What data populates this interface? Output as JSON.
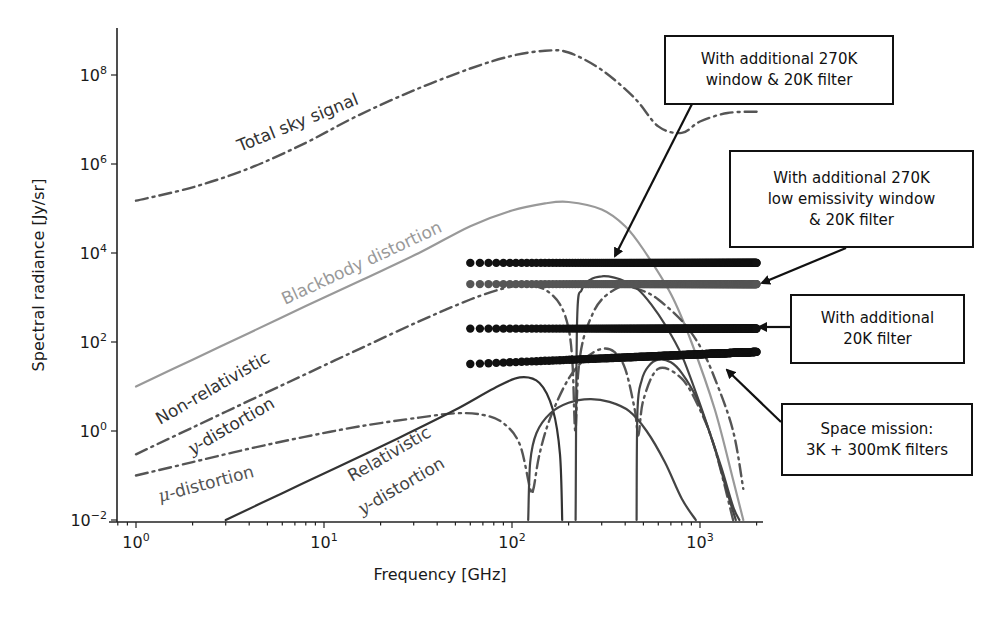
{
  "chart_data": {
    "type": "line",
    "title": "",
    "xlabel": "Frequency [GHz]",
    "ylabel": "Spectral radiance [Jy/sr]",
    "xscale": "log",
    "yscale": "log",
    "xlim": [
      0.78,
      2200
    ],
    "ylim": [
      0.01,
      1000000000.0
    ],
    "grid": false,
    "x_ticks": [
      {
        "value": 1,
        "base": "10",
        "exp": "0"
      },
      {
        "value": 10,
        "base": "10",
        "exp": "1"
      },
      {
        "value": 100,
        "base": "10",
        "exp": "2"
      },
      {
        "value": 1000,
        "base": "10",
        "exp": "3"
      }
    ],
    "y_ticks": [
      {
        "value": 0.01,
        "base": "10",
        "exp": "−2"
      },
      {
        "value": 1,
        "base": "10",
        "exp": "0"
      },
      {
        "value": 100,
        "base": "10",
        "exp": "2"
      },
      {
        "value": 10000,
        "base": "10",
        "exp": "4"
      },
      {
        "value": 1000000,
        "base": "10",
        "exp": "6"
      },
      {
        "value": 100000000,
        "base": "10",
        "exp": "8"
      }
    ],
    "series": [
      {
        "name": "Total sky signal",
        "style": "dashdot",
        "color": "#555555",
        "x": [
          1,
          2,
          4,
          8,
          15,
          30,
          60,
          100,
          150,
          200,
          300,
          450,
          600,
          800,
          1000,
          1400,
          2000
        ],
        "y": [
          150000.0,
          300000.0,
          800000.0,
          3000000.0,
          12000000.0,
          45000000.0,
          140000000.0,
          270000000.0,
          350000000.0,
          320000000.0,
          130000000.0,
          30000000.0,
          7000000.0,
          5000000.0,
          9000000.0,
          14000000.0,
          15000000.0
        ]
      },
      {
        "name": "Blackbody distortion",
        "style": "solid",
        "color": "#999999",
        "x": [
          1,
          2,
          4,
          8,
          16,
          32,
          60,
          100,
          150,
          200,
          300,
          400,
          500,
          700,
          900,
          1200,
          1500,
          1700
        ],
        "y": [
          10,
          40,
          160,
          640,
          2500,
          10000,
          40000,
          90000,
          130000,
          140000,
          95000,
          40000,
          12000,
          1200,
          100,
          3,
          0.08,
          0.01
        ]
      },
      {
        "name": "Non-relativistic y-distortion",
        "style": "dashdot",
        "color": "#555555",
        "x": [
          1,
          2,
          4,
          8,
          16,
          32,
          60,
          90,
          120,
          150,
          180,
          200,
          210,
          217,
          225,
          240,
          270,
          300,
          350,
          400,
          500,
          600,
          800,
          1000,
          1200,
          1500,
          1700
        ],
        "y": [
          0.3,
          1.2,
          4.8,
          19,
          75,
          290,
          900,
          1600,
          1900,
          1500,
          700,
          200,
          30,
          1,
          20,
          120,
          450,
          900,
          1500,
          1800,
          1400,
          900,
          300,
          80,
          15,
          1,
          0.05
        ]
      },
      {
        "name": "μ-distortion",
        "style": "dashdot",
        "color": "#555555",
        "x": [
          1,
          2,
          4,
          8,
          16,
          32,
          50,
          70,
          90,
          110,
          125,
          130,
          140,
          160,
          200,
          250,
          300,
          350,
          400,
          450,
          470,
          500,
          600,
          800,
          1000,
          1200,
          1500
        ],
        "y": [
          0.1,
          0.2,
          0.4,
          0.75,
          1.3,
          2,
          2.5,
          2.3,
          1.5,
          0.5,
          0.05,
          0.05,
          0.3,
          2,
          15,
          45,
          70,
          60,
          25,
          3,
          0.8,
          5,
          25,
          15,
          3,
          0.4,
          0.01
        ]
      },
      {
        "name": "Relativistic y-distortion (main)",
        "style": "solid",
        "color": "#333333",
        "x": [
          3,
          6,
          12,
          25,
          50,
          80,
          110,
          140,
          165,
          180,
          185
        ],
        "y": [
          0.01,
          0.04,
          0.16,
          0.7,
          3,
          9,
          16,
          12,
          3,
          0.3,
          0.01
        ]
      },
      {
        "name": "Relativistic y-distortion (lobe 2)",
        "style": "solid",
        "color": "#444444",
        "x": [
          122,
          125,
          135,
          160,
          200,
          260,
          330,
          420,
          520,
          650,
          800,
          950
        ],
        "y": [
          0.01,
          0.2,
          0.9,
          2.5,
          4.3,
          5.2,
          4.5,
          2.8,
          1.0,
          0.2,
          0.03,
          0.01
        ]
      },
      {
        "name": "Relativistic y-distortion (lobe 3)",
        "style": "solid",
        "color": "#444444",
        "x": [
          218,
          222,
          235,
          260,
          300,
          350,
          400,
          470,
          550,
          650,
          800,
          1000,
          1200,
          1400,
          1550
        ],
        "y": [
          0.01,
          300,
          1500,
          2500,
          3000,
          2800,
          2300,
          1500,
          700,
          250,
          50,
          4,
          0.4,
          0.04,
          0.01
        ]
      },
      {
        "name": "Relativistic y-distortion (lobe 4)",
        "style": "solid",
        "color": "#444444",
        "x": [
          460,
          465,
          490,
          530,
          600,
          700,
          800,
          950,
          1100,
          1300,
          1500,
          1620
        ],
        "y": [
          0.01,
          3,
          14,
          28,
          40,
          35,
          20,
          6,
          1.2,
          0.15,
          0.02,
          0.01
        ]
      }
    ],
    "sensitivity_rows": [
      {
        "name": "With additional 270K window & 20K filter",
        "x_start": 60,
        "x_end": 2000,
        "y_start": 6000.0,
        "y_end": 6000.0,
        "color": "#111111"
      },
      {
        "name": "With additional 270K low emissivity window & 20K filter",
        "x_start": 60,
        "x_end": 2000,
        "y_start": 2000.0,
        "y_end": 2000.0,
        "color": "#555555"
      },
      {
        "name": "With additional 20K filter",
        "x_start": 60,
        "x_end": 2000,
        "y_start": 200.0,
        "y_end": 200.0,
        "color": "#111111"
      },
      {
        "name": "Space mission: 3K + 300mK filters",
        "x_start": 60,
        "x_end": 2000,
        "y_start": 32,
        "y_end": 60,
        "color": "#111111"
      }
    ],
    "curve_labels": [
      {
        "text": "Total sky signal",
        "x": 240,
        "y": 152,
        "rotate": -22,
        "color": "#333333"
      },
      {
        "text": "Blackbody distortion",
        "x": 285,
        "y": 305,
        "rotate": -25,
        "color": "#999999"
      },
      {
        "text": "Non-relativistic",
        "x": 160,
        "y": 425,
        "rotate": -30,
        "color": "#333333"
      },
      {
        "text": "y-distortion",
        "x": 192,
        "y": 455,
        "rotate": -30,
        "color": "#333333"
      },
      {
        "text": "μ-distortion",
        "x": 160,
        "y": 502,
        "rotate": -15,
        "color": "#555555"
      },
      {
        "text": "Relativistic",
        "x": 352,
        "y": 482,
        "rotate": -30,
        "color": "#444444"
      },
      {
        "text": "y-distortion",
        "x": 362,
        "y": 515,
        "rotate": -30,
        "color": "#444444"
      }
    ],
    "annotations": [
      {
        "lines": [
          "With additional 270K",
          "window & 20K filter"
        ],
        "box": {
          "left": 664,
          "top": 35,
          "width": 230,
          "height": 70
        },
        "arrow_from": [
          692,
          104
        ],
        "arrow_to": [
          615,
          256
        ]
      },
      {
        "lines": [
          "With additional 270K",
          "low emissivity window",
          "& 20K filter"
        ],
        "box": {
          "left": 729,
          "top": 150,
          "width": 245,
          "height": 98
        },
        "arrow_from": [
          846,
          248
        ],
        "arrow_to": [
          762,
          283
        ]
      },
      {
        "lines": [
          "With additional",
          "20K filter"
        ],
        "box": {
          "left": 790,
          "top": 294,
          "width": 175,
          "height": 70
        },
        "arrow_from": [
          790,
          327
        ],
        "arrow_to": [
          759,
          327
        ]
      },
      {
        "lines": [
          "Space mission:",
          "3K + 300mK filters"
        ],
        "box": {
          "left": 781,
          "top": 403,
          "width": 192,
          "height": 73
        },
        "arrow_from": [
          781,
          422
        ],
        "arrow_to": [
          727,
          370
        ]
      }
    ]
  }
}
